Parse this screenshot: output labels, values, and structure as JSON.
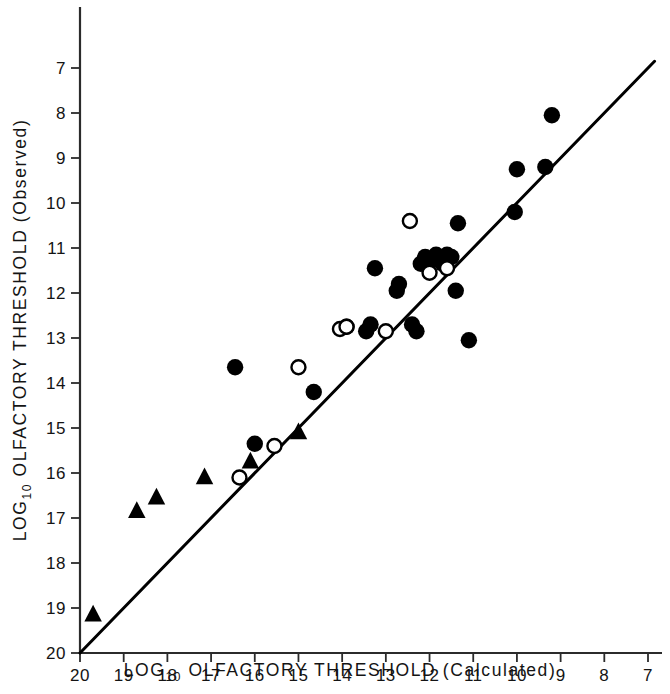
{
  "chart_data": {
    "type": "scatter",
    "title": "",
    "xlabel": "LOG10 OLFACTORY THRESHOLD (Calculated)",
    "ylabel": "LOG10 OLFACTORY THRESHOLD (Observed)",
    "xlabel_main": "LOG",
    "xlabel_sub": "10",
    "xlabel_rest": "OLFACTORY THRESHOLD (Calculated)",
    "ylabel_main": "LOG",
    "ylabel_sub": "10",
    "ylabel_rest": "OLFACTORY THRESHOLD (Observed)",
    "grid": false,
    "legend_position": "none",
    "xlim": [
      20,
      7
    ],
    "ylim": [
      20,
      6.5
    ],
    "x_axis_inverted": true,
    "y_axis_inverted": true,
    "xticks": [
      20,
      19,
      18,
      17,
      16,
      15,
      14,
      13,
      12,
      11,
      10,
      9,
      8,
      7
    ],
    "yticks": [
      7,
      8,
      9,
      10,
      11,
      12,
      13,
      14,
      15,
      16,
      17,
      18,
      19,
      20
    ],
    "xtick_labels": [
      "20",
      "19",
      "18",
      "17",
      "16",
      "15",
      "14",
      "13",
      "12",
      "11",
      "10",
      "9",
      "8",
      "7"
    ],
    "ytick_labels": [
      "7",
      "8",
      "9",
      "10",
      "11",
      "12",
      "13",
      "14",
      "15",
      "16",
      "17",
      "18",
      "19",
      "20"
    ],
    "reference_line": {
      "label": "identity line y = x",
      "from": [
        20.0,
        20.0
      ],
      "to": [
        6.85,
        6.85
      ]
    },
    "series": [
      {
        "name": "filled-circle",
        "marker": "filled-circle",
        "points": [
          [
            16.45,
            13.65
          ],
          [
            16.0,
            15.35
          ],
          [
            14.65,
            14.2
          ],
          [
            13.9,
            12.75
          ],
          [
            13.45,
            12.85
          ],
          [
            13.35,
            12.7
          ],
          [
            13.25,
            11.45
          ],
          [
            12.75,
            11.95
          ],
          [
            12.7,
            11.8
          ],
          [
            12.4,
            12.7
          ],
          [
            12.3,
            12.85
          ],
          [
            12.2,
            11.35
          ],
          [
            12.1,
            11.2
          ],
          [
            12.0,
            11.3
          ],
          [
            11.85,
            11.15
          ],
          [
            11.75,
            11.25
          ],
          [
            11.7,
            11.35
          ],
          [
            11.6,
            11.15
          ],
          [
            11.5,
            11.2
          ],
          [
            11.4,
            11.95
          ],
          [
            11.35,
            10.45
          ],
          [
            11.1,
            13.05
          ],
          [
            10.05,
            10.2
          ],
          [
            9.35,
            9.2
          ],
          [
            9.2,
            8.05
          ],
          [
            10.0,
            9.25
          ]
        ]
      },
      {
        "name": "open-circle",
        "marker": "open-circle",
        "points": [
          [
            16.35,
            16.1
          ],
          [
            15.55,
            15.4
          ],
          [
            15.0,
            13.65
          ],
          [
            14.05,
            12.8
          ],
          [
            13.9,
            12.75
          ],
          [
            13.0,
            12.85
          ],
          [
            12.45,
            10.4
          ],
          [
            12.0,
            11.55
          ],
          [
            11.6,
            11.45
          ]
        ]
      },
      {
        "name": "filled-triangle",
        "marker": "filled-triangle",
        "points": [
          [
            19.7,
            19.15
          ],
          [
            18.7,
            16.85
          ],
          [
            18.25,
            16.55
          ],
          [
            17.15,
            16.1
          ],
          [
            16.1,
            15.75
          ],
          [
            15.0,
            15.1
          ]
        ]
      }
    ]
  }
}
